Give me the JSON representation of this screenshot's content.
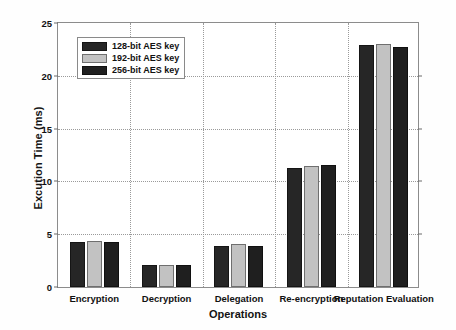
{
  "chart_data": {
    "type": "bar",
    "title": "",
    "xlabel": "Operations",
    "ylabel": "Excution Time (ms)",
    "categories": [
      "Encryption",
      "Decryption",
      "Delegation",
      "Re-encryption",
      "Reputation Evaluation"
    ],
    "series": [
      {
        "name": "128-bit AES key",
        "values": [
          4.2,
          2.1,
          3.9,
          11.2,
          22.7
        ]
      },
      {
        "name": "192-bit AES key",
        "values": [
          4.3,
          2.1,
          4.0,
          11.4,
          22.8
        ]
      },
      {
        "name": "256-bit AES key",
        "values": [
          4.2,
          2.1,
          3.9,
          11.5,
          22.6
        ]
      }
    ],
    "ylim": [
      0,
      25
    ],
    "yticks": [
      0,
      5,
      10,
      15,
      20,
      25
    ],
    "ytick_labels": [
      "0",
      "5",
      "10",
      "15",
      "20",
      "25"
    ],
    "grid": "dotted-both-axes",
    "legend_position": "upper-left-inside",
    "colors": {
      "series_128": "#262626",
      "series_192": "#c2c2c2",
      "series_256": "#1f1f1f",
      "grid": "#9a9a9a",
      "axis": "#8c8c8c",
      "text": "#111111",
      "background": "#ffffff"
    }
  },
  "legend": {
    "items": [
      {
        "label": "128-bit AES key"
      },
      {
        "label": "192-bit AES key"
      },
      {
        "label": "256-bit AES key"
      }
    ]
  }
}
